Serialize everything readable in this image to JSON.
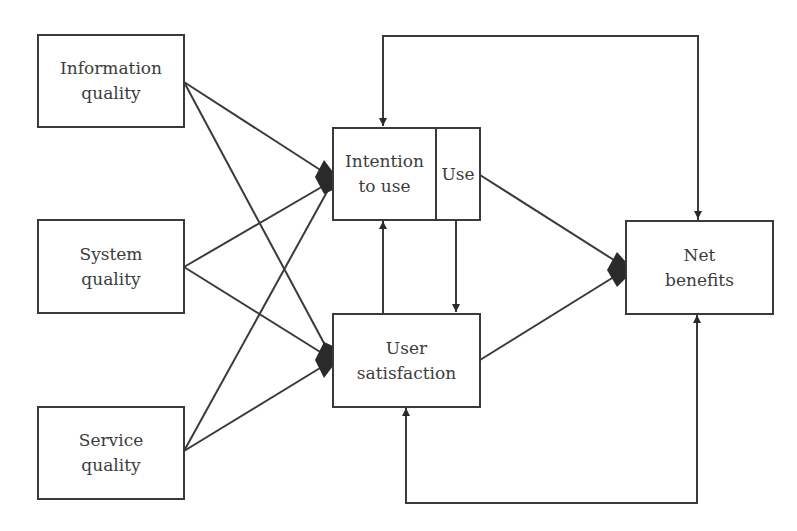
{
  "diagram": {
    "type": "flow-model",
    "nodes": [
      {
        "id": "information_quality",
        "lines": [
          "Information",
          "quality"
        ]
      },
      {
        "id": "system_quality",
        "lines": [
          "System",
          "quality"
        ]
      },
      {
        "id": "service_quality",
        "lines": [
          "Service",
          "quality"
        ]
      },
      {
        "id": "intention_to_use",
        "lines": [
          "Intention",
          "to use"
        ]
      },
      {
        "id": "use",
        "lines": [
          "Use"
        ]
      },
      {
        "id": "user_satisfaction",
        "lines": [
          "User",
          "satisfaction"
        ]
      },
      {
        "id": "net_benefits",
        "lines": [
          "Net",
          "benefits"
        ]
      }
    ],
    "edges": [
      {
        "from": "information_quality",
        "to": "intention_to_use"
      },
      {
        "from": "information_quality",
        "to": "user_satisfaction"
      },
      {
        "from": "system_quality",
        "to": "intention_to_use"
      },
      {
        "from": "system_quality",
        "to": "user_satisfaction"
      },
      {
        "from": "service_quality",
        "to": "intention_to_use"
      },
      {
        "from": "service_quality",
        "to": "user_satisfaction"
      },
      {
        "from": "user_satisfaction",
        "to": "intention_to_use"
      },
      {
        "from": "use",
        "to": "user_satisfaction"
      },
      {
        "from": "use",
        "to": "net_benefits"
      },
      {
        "from": "user_satisfaction",
        "to": "net_benefits"
      },
      {
        "from": "net_benefits",
        "to": "intention_to_use",
        "feedback": true
      },
      {
        "from": "net_benefits",
        "to": "user_satisfaction",
        "feedback": true
      }
    ],
    "colors": {
      "line": "#3a3a3a",
      "text": "#3c3c3c",
      "background": "#ffffff"
    }
  }
}
